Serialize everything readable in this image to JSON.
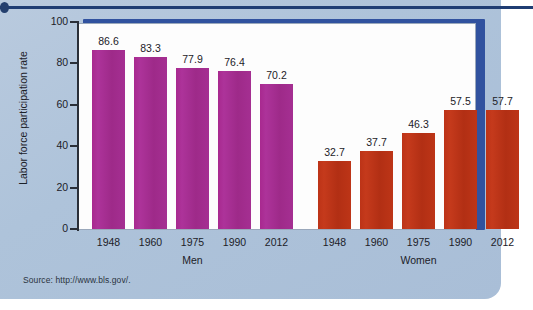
{
  "figure": {
    "source_note": "Source: http://www.bls.gov/.",
    "accent_frame_color": "#31529f",
    "panel_background": "#aec3da",
    "top_rule_color": "#1f3d73"
  },
  "chart_data": {
    "type": "bar",
    "title": "",
    "xlabel": "",
    "ylabel": "Labor force participation rate",
    "ylim": [
      0,
      100
    ],
    "yticks": [
      0,
      20,
      40,
      60,
      80,
      100
    ],
    "ytick_labels": [
      "0",
      "20",
      "40",
      "60",
      "80",
      "100"
    ],
    "grid": false,
    "legend": "none",
    "categories": [
      "1948",
      "1960",
      "1975",
      "1990",
      "2012"
    ],
    "groups": [
      {
        "name": "Men",
        "color": "#a8298f",
        "categories": [
          "1948",
          "1960",
          "1975",
          "1990",
          "2012"
        ],
        "values": [
          86.6,
          83.3,
          77.9,
          76.4,
          70.2
        ],
        "value_labels": [
          "86.6",
          "83.3",
          "77.9",
          "76.4",
          "70.2"
        ]
      },
      {
        "name": "Women",
        "color": "#bc3317",
        "categories": [
          "1948",
          "1960",
          "1975",
          "1990",
          "2012"
        ],
        "values": [
          32.7,
          37.7,
          46.3,
          57.5,
          57.7
        ],
        "value_labels": [
          "32.7",
          "37.7",
          "46.3",
          "57.5",
          "57.7"
        ]
      }
    ],
    "series": [
      {
        "name": "Men",
        "values": [
          86.6,
          83.3,
          77.9,
          76.4,
          70.2
        ]
      },
      {
        "name": "Women",
        "values": [
          32.7,
          37.7,
          46.3,
          57.5,
          57.7
        ]
      }
    ]
  }
}
